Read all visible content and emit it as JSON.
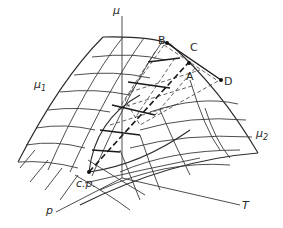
{
  "diagram": {
    "type": "3d-surface",
    "axes": {
      "vertical": "μ",
      "depth": "p",
      "horizontal": "T"
    },
    "surface_labels": {
      "left": {
        "base": "μ",
        "sub": "1"
      },
      "right": {
        "base": "μ",
        "sub": "2"
      }
    },
    "points": {
      "B": "B",
      "C": "C",
      "A": "A",
      "D": "D",
      "cp": "c.p."
    }
  }
}
